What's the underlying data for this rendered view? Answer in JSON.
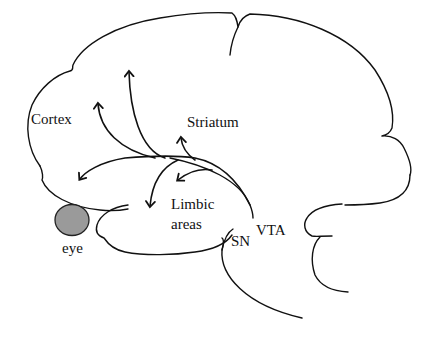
{
  "diagram": {
    "labels": {
      "cortex": "Cortex",
      "striatum": "Striatum",
      "limbic_line1": "Limbic",
      "limbic_line2": "areas",
      "sn": "SN",
      "vta": "VTA",
      "eye": "eye"
    },
    "colors": {
      "stroke": "#111111",
      "eye_fill": "#9a9a9a",
      "background": "#ffffff"
    },
    "nodes": [
      {
        "id": "cortex",
        "label": "Cortex"
      },
      {
        "id": "striatum",
        "label": "Striatum"
      },
      {
        "id": "limbic",
        "label": "Limbic areas"
      },
      {
        "id": "sn",
        "label": "SN"
      },
      {
        "id": "vta",
        "label": "VTA"
      },
      {
        "id": "eye",
        "label": "eye"
      }
    ],
    "edges": [
      {
        "from": "vta",
        "to": "cortex",
        "note": "arrow up (tall)"
      },
      {
        "from": "vta",
        "to": "cortex",
        "note": "arrow up (short, left)"
      },
      {
        "from": "vta",
        "to": "cortex",
        "note": "arrow frontal (left-down)"
      },
      {
        "from": "sn",
        "to": "striatum",
        "note": "arrow up near Striatum"
      },
      {
        "from": "vta",
        "to": "limbic",
        "note": "arrow down"
      },
      {
        "from": "vta",
        "to": "limbic",
        "note": "arrow down-left small"
      }
    ]
  }
}
